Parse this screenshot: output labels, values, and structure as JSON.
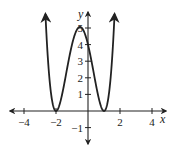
{
  "chart_data": {
    "type": "line",
    "title": "",
    "xlabel": "x",
    "ylabel": "y",
    "xlim": [
      -5,
      5
    ],
    "ylim": [
      -2,
      5.5
    ],
    "x_ticks": [
      -4,
      -2,
      2,
      4
    ],
    "y_ticks": [
      -1,
      1,
      2,
      3,
      4,
      5
    ],
    "grid": false,
    "series": [
      {
        "name": "f(x)",
        "description": "polynomial with double roots at x=-2 and x=1, local max near (-0.5, 5), y-intercept 4, arrows at both ends pointing up",
        "points": [
          {
            "x": -2.75,
            "y": 17.4
          },
          {
            "x": -2.5,
            "y": 3.06
          },
          {
            "x": -2,
            "y": 0
          },
          {
            "x": -1.5,
            "y": 1.56
          },
          {
            "x": -1,
            "y": 4
          },
          {
            "x": -0.5,
            "y": 5.06
          },
          {
            "x": 0,
            "y": 4
          },
          {
            "x": 0.5,
            "y": 1.56
          },
          {
            "x": 1,
            "y": 0
          },
          {
            "x": 1.5,
            "y": 3.06
          }
        ]
      }
    ]
  },
  "labels": {
    "x_axis": "x",
    "y_axis": "y",
    "x_ticks": [
      "−4",
      "−2",
      "2",
      "4"
    ],
    "y_ticks": [
      "5",
      "4",
      "3",
      "2",
      "1",
      "−1"
    ]
  }
}
